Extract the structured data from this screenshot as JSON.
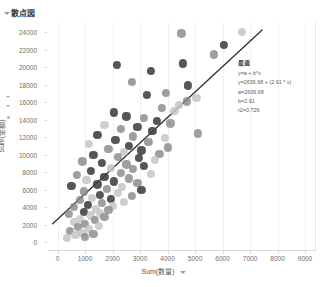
{
  "header": {
    "title": "散点図",
    "caret_icon": "triangle-down-icon"
  },
  "axes": {
    "x_title": "Sum(数量)",
    "y_title": "Sum(金額)",
    "x_caret_icon": "triangle-down-icon",
    "y_caret_icon": "triangle-down-icon"
  },
  "annotation": {
    "heading": "最適",
    "lines": [
      "y=a + b*x",
      "y=2636.68 + (2.91 * x)",
      "a=2636.68",
      "b=2.91",
      "r2=0.726"
    ]
  },
  "colors": {
    "point_dark": "#3f3f3f",
    "point_mid": "#8a8a8a",
    "point_light": "#c6c6c6",
    "trend_line": "#2f2f2f",
    "grid": "#f1f1f1",
    "axis": "#dcdcdc",
    "text": "#6e6e6e",
    "background": "#ffffff"
  },
  "chart_data": {
    "type": "scatter",
    "title": "散点図",
    "xlabel": "Sum(数量)",
    "ylabel": "Sum(金額)",
    "xlim": [
      -350,
      9400
    ],
    "ylim": [
      -900,
      25200
    ],
    "xticks": [
      0,
      1000,
      2000,
      3000,
      4000,
      5000,
      6000,
      7000,
      8000,
      9000
    ],
    "yticks": [
      0,
      2000,
      4000,
      6000,
      8000,
      10000,
      12000,
      14000,
      16000,
      18000,
      20000,
      22000,
      24000
    ],
    "grid": "vertical-faint",
    "legend": "none",
    "trendline": {
      "model": "y=a + b*x",
      "equation": "y=2636.68 + (2.91 * x)",
      "a": 2636.68,
      "b": 2.91,
      "r2": 0.726,
      "x_start": -200,
      "x_end": 7450
    },
    "points": [
      {
        "x": 6700,
        "y": 24050,
        "shade": "light"
      },
      {
        "x": 4500,
        "y": 23900,
        "shade": "mid"
      },
      {
        "x": 6050,
        "y": 22550,
        "shade": "dark"
      },
      {
        "x": 5700,
        "y": 21500,
        "shade": "mid"
      },
      {
        "x": 4550,
        "y": 20450,
        "shade": "dark"
      },
      {
        "x": 2150,
        "y": 20250,
        "shade": "dark"
      },
      {
        "x": 3400,
        "y": 19600,
        "shade": "dark"
      },
      {
        "x": 2700,
        "y": 18350,
        "shade": "mid"
      },
      {
        "x": 4750,
        "y": 17950,
        "shade": "dark"
      },
      {
        "x": 3950,
        "y": 17100,
        "shade": "mid"
      },
      {
        "x": 3250,
        "y": 16900,
        "shade": "dark"
      },
      {
        "x": 5050,
        "y": 16500,
        "shade": "light"
      },
      {
        "x": 4700,
        "y": 16100,
        "shade": "mid"
      },
      {
        "x": 4400,
        "y": 15700,
        "shade": "light"
      },
      {
        "x": 3800,
        "y": 15350,
        "shade": "mid"
      },
      {
        "x": 4250,
        "y": 15000,
        "shade": "light"
      },
      {
        "x": 2050,
        "y": 14850,
        "shade": "dark"
      },
      {
        "x": 2500,
        "y": 14400,
        "shade": "dark"
      },
      {
        "x": 3150,
        "y": 14200,
        "shade": "mid"
      },
      {
        "x": 3600,
        "y": 13900,
        "shade": "dark"
      },
      {
        "x": 4100,
        "y": 13600,
        "shade": "mid"
      },
      {
        "x": 1700,
        "y": 13450,
        "shade": "light"
      },
      {
        "x": 2900,
        "y": 13200,
        "shade": "dark"
      },
      {
        "x": 2300,
        "y": 12950,
        "shade": "mid"
      },
      {
        "x": 3450,
        "y": 12700,
        "shade": "dark"
      },
      {
        "x": 5100,
        "y": 12450,
        "shade": "mid"
      },
      {
        "x": 1450,
        "y": 12300,
        "shade": "dark"
      },
      {
        "x": 2750,
        "y": 12100,
        "shade": "mid"
      },
      {
        "x": 3900,
        "y": 11950,
        "shade": "light"
      },
      {
        "x": 2100,
        "y": 11700,
        "shade": "dark"
      },
      {
        "x": 3300,
        "y": 11450,
        "shade": "mid"
      },
      {
        "x": 1150,
        "y": 11250,
        "shade": "light"
      },
      {
        "x": 2600,
        "y": 11050,
        "shade": "dark"
      },
      {
        "x": 4000,
        "y": 10850,
        "shade": "mid"
      },
      {
        "x": 1850,
        "y": 10700,
        "shade": "mid"
      },
      {
        "x": 3050,
        "y": 10500,
        "shade": "dark"
      },
      {
        "x": 2400,
        "y": 10300,
        "shade": "light"
      },
      {
        "x": 3700,
        "y": 10100,
        "shade": "mid"
      },
      {
        "x": 1300,
        "y": 9950,
        "shade": "dark"
      },
      {
        "x": 2200,
        "y": 9750,
        "shade": "mid"
      },
      {
        "x": 2950,
        "y": 9600,
        "shade": "dark"
      },
      {
        "x": 3550,
        "y": 9400,
        "shade": "light"
      },
      {
        "x": 900,
        "y": 9250,
        "shade": "mid"
      },
      {
        "x": 1600,
        "y": 9050,
        "shade": "dark"
      },
      {
        "x": 2500,
        "y": 8900,
        "shade": "mid"
      },
      {
        "x": 3150,
        "y": 8700,
        "shade": "dark"
      },
      {
        "x": 1950,
        "y": 8500,
        "shade": "light"
      },
      {
        "x": 2750,
        "y": 8350,
        "shade": "mid"
      },
      {
        "x": 1200,
        "y": 8150,
        "shade": "dark"
      },
      {
        "x": 2300,
        "y": 7950,
        "shade": "mid"
      },
      {
        "x": 3400,
        "y": 7800,
        "shade": "light"
      },
      {
        "x": 700,
        "y": 7650,
        "shade": "mid"
      },
      {
        "x": 1700,
        "y": 7450,
        "shade": "dark"
      },
      {
        "x": 2600,
        "y": 7300,
        "shade": "mid"
      },
      {
        "x": 1050,
        "y": 7100,
        "shade": "light"
      },
      {
        "x": 2050,
        "y": 6950,
        "shade": "dark"
      },
      {
        "x": 2900,
        "y": 6800,
        "shade": "mid"
      },
      {
        "x": 1450,
        "y": 6600,
        "shade": "dark"
      },
      {
        "x": 500,
        "y": 6450,
        "shade": "dark"
      },
      {
        "x": 2350,
        "y": 6300,
        "shade": "light"
      },
      {
        "x": 1800,
        "y": 6100,
        "shade": "mid"
      },
      {
        "x": 3050,
        "y": 5950,
        "shade": "dark"
      },
      {
        "x": 950,
        "y": 5800,
        "shade": "mid"
      },
      {
        "x": 2200,
        "y": 5650,
        "shade": "light"
      },
      {
        "x": 1550,
        "y": 5450,
        "shade": "dark"
      },
      {
        "x": 2700,
        "y": 5300,
        "shade": "mid"
      },
      {
        "x": 1250,
        "y": 5100,
        "shade": "light"
      },
      {
        "x": 1950,
        "y": 4950,
        "shade": "dark"
      },
      {
        "x": 800,
        "y": 4800,
        "shade": "mid"
      },
      {
        "x": 2400,
        "y": 4650,
        "shade": "light"
      },
      {
        "x": 1600,
        "y": 4450,
        "shade": "mid"
      },
      {
        "x": 1100,
        "y": 4300,
        "shade": "dark"
      },
      {
        "x": 2000,
        "y": 4150,
        "shade": "light"
      },
      {
        "x": 600,
        "y": 4000,
        "shade": "mid"
      },
      {
        "x": 1400,
        "y": 3850,
        "shade": "light"
      },
      {
        "x": 1850,
        "y": 3700,
        "shade": "mid"
      },
      {
        "x": 950,
        "y": 3500,
        "shade": "dark"
      },
      {
        "x": 1550,
        "y": 3350,
        "shade": "light"
      },
      {
        "x": 400,
        "y": 3200,
        "shade": "mid"
      },
      {
        "x": 1200,
        "y": 3050,
        "shade": "light"
      },
      {
        "x": 1700,
        "y": 2900,
        "shade": "mid"
      },
      {
        "x": 800,
        "y": 2700,
        "shade": "light"
      },
      {
        "x": 1350,
        "y": 2500,
        "shade": "mid"
      },
      {
        "x": 600,
        "y": 2300,
        "shade": "light"
      },
      {
        "x": 1000,
        "y": 2100,
        "shade": "mid"
      },
      {
        "x": 1500,
        "y": 1900,
        "shade": "light"
      },
      {
        "x": 750,
        "y": 1700,
        "shade": "mid"
      },
      {
        "x": 1150,
        "y": 1500,
        "shade": "light"
      },
      {
        "x": 450,
        "y": 1300,
        "shade": "mid"
      },
      {
        "x": 900,
        "y": 1100,
        "shade": "light"
      },
      {
        "x": 1300,
        "y": 950,
        "shade": "mid"
      },
      {
        "x": 650,
        "y": 800,
        "shade": "light"
      },
      {
        "x": 1000,
        "y": 600,
        "shade": "mid"
      },
      {
        "x": 350,
        "y": 450,
        "shade": "light"
      }
    ]
  }
}
